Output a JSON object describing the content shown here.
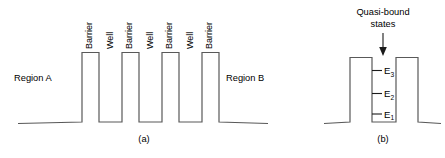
{
  "figure": {
    "panels": [
      {
        "id": "a",
        "caption": "(a)",
        "region_left_label": "Region A",
        "region_right_label": "Region B",
        "structure_labels": [
          "Barrier",
          "Well",
          "Barrier",
          "Well",
          "Barrier",
          "Well",
          "Barrier"
        ]
      },
      {
        "id": "b",
        "caption": "(b)",
        "annotation_line1": "Quasi-bound",
        "annotation_line2": "states",
        "levels": [
          {
            "symbol": "E",
            "subscript": "3"
          },
          {
            "symbol": "E",
            "subscript": "2"
          },
          {
            "symbol": "E",
            "subscript": "1"
          }
        ]
      }
    ],
    "colors": {
      "line": "#595959",
      "text": "#000000",
      "accent": "#1a1a1a",
      "background": "#ffffff"
    }
  }
}
